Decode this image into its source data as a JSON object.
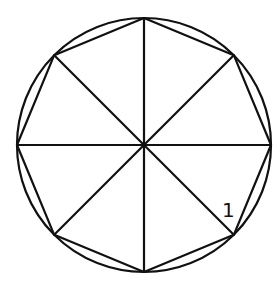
{
  "diagram": {
    "circle": {
      "cx": 144,
      "cy": 145,
      "r": 127
    },
    "octagon_vertices": [
      [
        144,
        18
      ],
      [
        233.8,
        55.2
      ],
      [
        271,
        145
      ],
      [
        233.8,
        234.8
      ],
      [
        144,
        272
      ],
      [
        54.2,
        234.8
      ],
      [
        17,
        145
      ],
      [
        54.2,
        55.2
      ]
    ],
    "labels": [
      {
        "text": "1",
        "x": 222,
        "y": 217
      }
    ],
    "colors": {
      "stroke": "#111111",
      "background": "#ffffff"
    }
  }
}
